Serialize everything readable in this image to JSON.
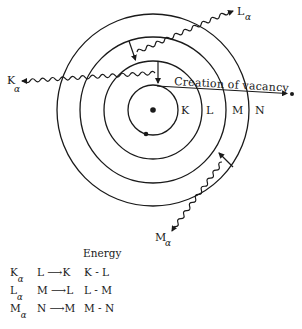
{
  "diagram": {
    "nucleus": {
      "cx": 153,
      "cy": 110
    },
    "shells": [
      {
        "name": "K",
        "label": "K",
        "radius": 25
      },
      {
        "name": "L",
        "label": "L",
        "radius": 49
      },
      {
        "name": "M",
        "label": "M",
        "radius": 73
      },
      {
        "name": "N",
        "label": "N",
        "radius": 96
      }
    ],
    "ejection_caption": "Creation of vacancy",
    "emissions": [
      {
        "symbol": "K",
        "subscript": "α",
        "transition": "L → K"
      },
      {
        "symbol": "L",
        "subscript": "α",
        "transition": "M → L"
      },
      {
        "symbol": "M",
        "subscript": "α",
        "transition": "N → M"
      }
    ],
    "colors": {
      "line": "#1a1a1a",
      "background": "#ffffff"
    }
  },
  "table": {
    "header": "Energy",
    "rows": [
      {
        "line": "K",
        "sub": "α",
        "transition_from": "L",
        "transition_to": "K",
        "energy": "K - L"
      },
      {
        "line": "L",
        "sub": "α",
        "transition_from": "M",
        "transition_to": "L",
        "energy": "L - M"
      },
      {
        "line": "M",
        "sub": "α",
        "transition_from": "N",
        "transition_to": "M",
        "energy": "M - N"
      }
    ]
  }
}
